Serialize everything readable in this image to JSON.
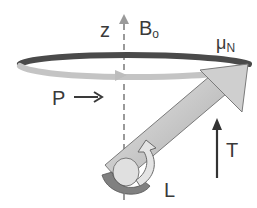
{
  "diagram": {
    "type": "nuclear-spin-precession",
    "labels": {
      "z_axis": "z",
      "field": "B",
      "field_sub": "o",
      "magnetic_moment": "μ",
      "magnetic_moment_sub": "N",
      "precession": "P",
      "precession_arrow": "→",
      "torque": "T",
      "angular_momentum": "L"
    },
    "colors": {
      "orbit_dark": "#4a4a4a",
      "orbit_light": "#bdbdbd",
      "axis_dashed": "#9a9a9a",
      "vector_fill": "#c9c9c9",
      "vector_outline": "#6a6a6a",
      "spin_arrow_dark": "#7a7a7a",
      "spin_arrow_light": "#e0e0e0",
      "text": "#3a3a3a"
    }
  }
}
